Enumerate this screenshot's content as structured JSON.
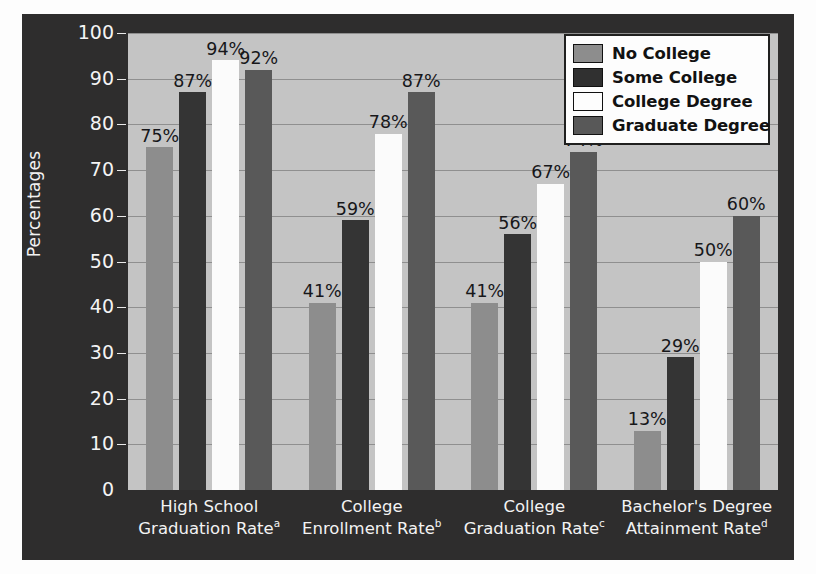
{
  "chart_data": {
    "type": "bar",
    "title": "",
    "xlabel": "",
    "ylabel": "Percentages",
    "ylim": [
      0,
      100
    ],
    "yticks": [
      0,
      10,
      20,
      30,
      40,
      50,
      60,
      70,
      80,
      90,
      100
    ],
    "ytick_labels": [
      "0",
      "10",
      "20",
      "30",
      "40",
      "50",
      "60",
      "70",
      "80",
      "90",
      "100"
    ],
    "grid": true,
    "legend_position": "top-right",
    "value_suffix": "%",
    "categories": [
      {
        "line1": "High School",
        "line2": "Graduation Rate",
        "note": "a"
      },
      {
        "line1": "College",
        "line2": "Enrollment Rate",
        "note": "b"
      },
      {
        "line1": "College",
        "line2": "Graduation Rate",
        "note": "c"
      },
      {
        "line1": "Bachelor's Degree",
        "line2": "Attainment Rate",
        "note": "d"
      }
    ],
    "series": [
      {
        "name": "No College",
        "color": "#8d8d8d",
        "values": [
          75,
          41,
          41,
          13
        ],
        "labels": [
          "75%",
          "41%",
          "41%",
          "13%"
        ]
      },
      {
        "name": "Some College",
        "color": "#343434",
        "values": [
          87,
          59,
          56,
          29
        ],
        "labels": [
          "87%",
          "59%",
          "56%",
          "29%"
        ]
      },
      {
        "name": "College Degree",
        "color": "#fbfbfb",
        "values": [
          94,
          78,
          67,
          50
        ],
        "labels": [
          "94%",
          "78%",
          "67%",
          "50%"
        ]
      },
      {
        "name": "Graduate Degree",
        "color": "#595959",
        "values": [
          92,
          87,
          74,
          60
        ],
        "labels": [
          "92%",
          "87%",
          "74%",
          "60%"
        ]
      }
    ]
  },
  "legend": {
    "items": [
      {
        "label": "No College"
      },
      {
        "label": "Some College"
      },
      {
        "label": "College Degree"
      },
      {
        "label": "Graduate Degree"
      }
    ]
  },
  "colors": {
    "chart_background": "#2e2d2d",
    "plot_background": "#c4c4c4",
    "gridline": "#8f8f8f",
    "axis_text": "#f3f3f3",
    "label_text": "#17171a"
  }
}
